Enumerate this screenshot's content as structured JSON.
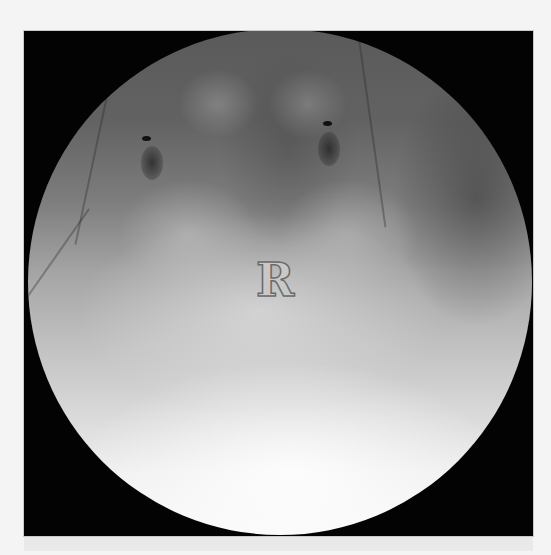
{
  "image": {
    "type": "fluoroscopy",
    "side_marker": "R",
    "colors": {
      "frame": "#030303",
      "background": "#f4f4f4",
      "fov_top": "#5a5a5a",
      "fov_bottom": "#f8f8f8",
      "marker_stroke": "#6a6a6a"
    },
    "features": [
      {
        "name": "left-radiopaque-marker",
        "shape": "dot-and-oval"
      },
      {
        "name": "right-radiopaque-marker",
        "shape": "dot-and-oval"
      },
      {
        "name": "bladder-contrast",
        "shape": "large-bright-ellipse"
      }
    ]
  }
}
